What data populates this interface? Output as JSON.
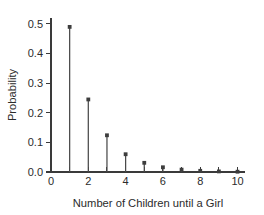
{
  "chart_data": {
    "type": "scatter",
    "plot_style": "stem",
    "title": "",
    "xlabel": "Number of Children until a Girl",
    "ylabel": "Probability",
    "x": [
      1,
      2,
      3,
      4,
      5,
      6,
      7,
      8,
      9,
      10
    ],
    "values": [
      0.49,
      0.245,
      0.124,
      0.06,
      0.031,
      0.016,
      0.008,
      0.004,
      0.002,
      0.001
    ],
    "xlim": [
      0,
      10.4
    ],
    "ylim": [
      0.0,
      0.52
    ],
    "x_ticks": [
      0,
      1,
      2,
      3,
      4,
      5,
      6,
      7,
      8,
      9,
      10
    ],
    "x_tick_labels": [
      "0",
      "",
      "2",
      "",
      "4",
      "",
      "6",
      "",
      "8",
      "",
      "10"
    ],
    "y_ticks": [
      0.0,
      0.1,
      0.2,
      0.3,
      0.4,
      0.5
    ],
    "y_tick_labels": [
      "0.0",
      "0.1",
      "0.2",
      "0.3",
      "0.4",
      "0.5"
    ],
    "grid": false,
    "legend": false,
    "marker_color": "#3d3d3d",
    "stem_color": "#4a4a4a",
    "axis_color": "#3a3a3a",
    "background_color": "#ffffff"
  }
}
